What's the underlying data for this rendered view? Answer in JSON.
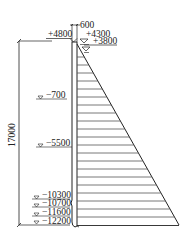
{
  "diagram": {
    "type": "retaining-wall-pressure-diagram",
    "wall_thickness_label": "600",
    "top_elevation_label": "+4800",
    "water_levels": [
      {
        "label": "+4300"
      },
      {
        "label": "+3800"
      }
    ],
    "overall_height_label": "17000",
    "elevations": [
      {
        "label": "−700"
      },
      {
        "label": "−5500"
      },
      {
        "label": "−10300"
      },
      {
        "label": "−10700"
      },
      {
        "label": "−11600"
      },
      {
        "label": "−12200"
      }
    ],
    "colors": {
      "line": "#222222",
      "hatch": "#555555",
      "background": "#ffffff"
    }
  }
}
